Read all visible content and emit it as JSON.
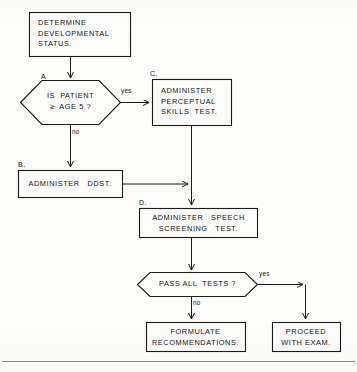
{
  "diagram": {
    "title_text": "",
    "line_color": "#1a1a1a",
    "text_color": "#141414",
    "background_color": "#fdfdfc"
  },
  "nodes": {
    "start": {
      "step": "",
      "shape": "process",
      "lines": [
        "DETERMINE",
        "DEVELOPMENTAL",
        "STATUS."
      ]
    },
    "decision_a": {
      "step": "A",
      "shape": "decision",
      "lines": [
        "IS  PATIENT",
        "≥  AGE 5 ?"
      ]
    },
    "process_c": {
      "step": "C.",
      "shape": "process",
      "lines": [
        "ADMINISTER",
        "PERCEPTUAL",
        "SKILLS  TEST."
      ]
    },
    "process_b": {
      "step": "B.",
      "shape": "process",
      "lines": [
        "ADMINISTER   DDST."
      ]
    },
    "process_d": {
      "step": "D.",
      "shape": "process",
      "lines": [
        "ADMINISTER   SPEECH",
        "SCREENING   TEST."
      ]
    },
    "decision_pass": {
      "step": "",
      "shape": "decision",
      "lines": [
        "PASS ALL  TESTS ?"
      ]
    },
    "process_formulate": {
      "step": "",
      "shape": "process",
      "lines": [
        "FORMULATE",
        "RECOMMENDATIONS."
      ]
    },
    "process_proceed": {
      "step": "",
      "shape": "process",
      "lines": [
        "PROCEED",
        "WITH EXAM."
      ]
    }
  },
  "edges": {
    "a_yes": "yes",
    "a_no": "no",
    "pass_yes": "yes",
    "pass_no": "no"
  }
}
